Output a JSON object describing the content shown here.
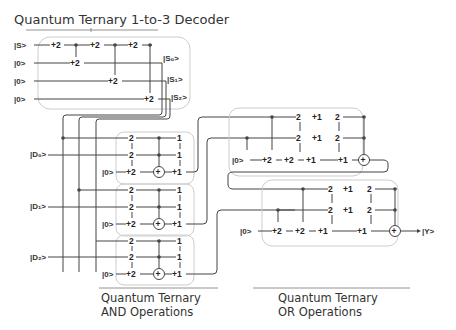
{
  "title": "Quantum Ternary 1-to-3 Decoder",
  "decoder": {
    "inputs": [
      "|S>",
      "|0>",
      "|0>",
      "|0>"
    ],
    "gates_row0": [
      "+2",
      "+2",
      "+2"
    ],
    "gates_row1": "+2",
    "gates_row2": "+2",
    "gates_row3": "+2",
    "outputs": [
      "|S₀>",
      "|S₁>",
      "|S₂>"
    ]
  },
  "and_blocks": [
    {
      "input": "|D₀>",
      "ancilla": "|0>",
      "col1": [
        "2",
        "2",
        "+2"
      ],
      "col2": [
        "1",
        "1",
        "+1"
      ]
    },
    {
      "input": "|D₁>",
      "ancilla": "|0>",
      "col1": [
        "2",
        "2",
        "+2"
      ],
      "col2": [
        "1",
        "1",
        "+1"
      ]
    },
    {
      "input": "|D₂>",
      "ancilla": "|0>",
      "col1": [
        "2",
        "2",
        "+2"
      ],
      "col2": [
        "1",
        "1",
        "+1"
      ]
    }
  ],
  "or_blocks": [
    {
      "ancilla": "|0>",
      "row0": [
        "2",
        "+1",
        "2"
      ],
      "row1": [
        "2",
        "+1",
        "2"
      ],
      "row2": [
        "+2",
        "+2",
        "+1",
        "+1"
      ]
    },
    {
      "ancilla": "|0>",
      "row0": [
        "2",
        "+1",
        "2"
      ],
      "row1": [
        "2",
        "+1",
        "2"
      ],
      "row2": [
        "+2",
        "+2",
        "+1",
        "+1"
      ],
      "output": "|Y>"
    }
  ],
  "captions": {
    "and_line1": "Quantum Ternary",
    "and_line2": "AND Operations",
    "or_line1": "Quantum Ternary",
    "or_line2": "OR Operations"
  },
  "colors": {
    "wire": "#444444",
    "box": "#cccccc",
    "text": "#333333"
  }
}
